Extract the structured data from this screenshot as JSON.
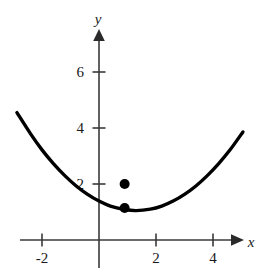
{
  "chart_data": {
    "type": "line",
    "title": "",
    "subtitle": "",
    "xlabel": "x",
    "ylabel": "y",
    "grid": false,
    "legend": false,
    "legend_position": "none",
    "xlim": [
      -2.9,
      5.4
    ],
    "ylim": [
      -0.95,
      7.4
    ],
    "x_ticks": [
      -2,
      2,
      4
    ],
    "x_tick_labels": [
      "-2",
      "2",
      "4"
    ],
    "y_ticks": [
      2,
      4,
      6
    ],
    "y_tick_labels": [
      "2",
      "4",
      "6"
    ],
    "curve": {
      "name": "parabola",
      "equation": "y = 0.2(x - 1.3)^2 + 1.05",
      "vertex": [
        1.3,
        1.05
      ],
      "leading_coefficient": 0.2,
      "x_start": -2.88,
      "x_end": 5.05,
      "color": "#000000",
      "line_width": 3.4,
      "points": [
        [
          -2.88,
          4.55
        ],
        [
          -2.4,
          3.79
        ],
        [
          -2.0,
          3.22
        ],
        [
          -1.6,
          2.73
        ],
        [
          -1.2,
          2.3
        ],
        [
          -0.8,
          1.93
        ],
        [
          -0.4,
          1.63
        ],
        [
          0.0,
          1.39
        ],
        [
          0.4,
          1.21
        ],
        [
          0.9,
          1.09
        ],
        [
          1.3,
          1.05
        ],
        [
          1.8,
          1.1
        ],
        [
          2.2,
          1.21
        ],
        [
          2.6,
          1.39
        ],
        [
          3.0,
          1.63
        ],
        [
          3.4,
          1.93
        ],
        [
          3.8,
          2.3
        ],
        [
          4.2,
          2.73
        ],
        [
          4.6,
          3.22
        ],
        [
          5.05,
          3.86
        ]
      ]
    },
    "points": [
      {
        "name": "upper-point",
        "x": 0.9,
        "y": 2.0,
        "marker": "filled-circle",
        "radius": 5,
        "color": "#000000",
        "on_curve": false
      },
      {
        "name": "vertex-region-point",
        "x": 0.9,
        "y": 1.14,
        "marker": "filled-circle",
        "radius": 5,
        "color": "#000000",
        "on_curve": true
      }
    ],
    "axis_color": "#3a3a3a",
    "axis_line_width": 1.6
  }
}
